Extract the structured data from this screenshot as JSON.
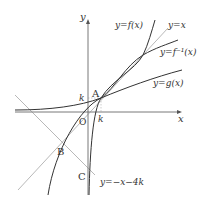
{
  "diagram": {
    "axes": {
      "x_label": "x",
      "y_label": "y",
      "origin_label": "O"
    },
    "points": {
      "A": "A",
      "B": "B",
      "C": "C"
    },
    "ticks": {
      "k_x": "k",
      "k_y": "k"
    },
    "curves": {
      "f": "y=f(x)",
      "identity": "y=x",
      "f_inverse": "y=f⁻¹(x)",
      "g": "y=g(x)",
      "line": "y=−x−4k"
    },
    "colors": {
      "curve": "#333333",
      "line": "#777777",
      "axis": "#555555"
    }
  }
}
